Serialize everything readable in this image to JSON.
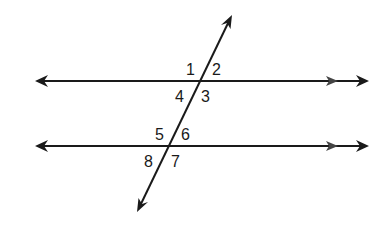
{
  "diagram": {
    "type": "parallel-lines-cut-by-transversal",
    "colors": {
      "line": "#1a1a1a",
      "background": "#ffffff"
    },
    "lines": [
      {
        "name": "upper-parallel-line",
        "y": 81,
        "x1": 35,
        "x2": 368,
        "parallel_marker": true
      },
      {
        "name": "lower-parallel-line",
        "y": 146,
        "x1": 35,
        "x2": 368,
        "parallel_marker": true
      },
      {
        "name": "transversal",
        "x1": 137,
        "y1": 212,
        "x2": 232,
        "y2": 15
      }
    ],
    "angle_labels": [
      {
        "id": "1",
        "text": "1",
        "x": 186,
        "y": 75
      },
      {
        "id": "2",
        "text": "2",
        "x": 212,
        "y": 75
      },
      {
        "id": "3",
        "text": "3",
        "x": 201,
        "y": 102
      },
      {
        "id": "4",
        "text": "4",
        "x": 175,
        "y": 102
      },
      {
        "id": "5",
        "text": "5",
        "x": 155,
        "y": 140
      },
      {
        "id": "6",
        "text": "6",
        "x": 181,
        "y": 140
      },
      {
        "id": "7",
        "text": "7",
        "x": 171,
        "y": 167
      },
      {
        "id": "8",
        "text": "8",
        "x": 144,
        "y": 167
      }
    ]
  }
}
